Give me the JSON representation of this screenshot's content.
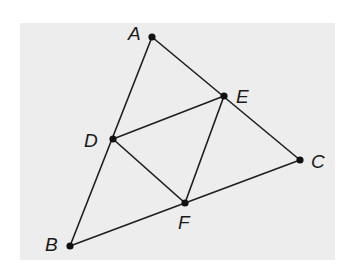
{
  "diagram": {
    "type": "geometry-figure",
    "points": [
      {
        "name": "A",
        "label": "A"
      },
      {
        "name": "B",
        "label": "B"
      },
      {
        "name": "C",
        "label": "C"
      },
      {
        "name": "D",
        "label": "D"
      },
      {
        "name": "E",
        "label": "E"
      },
      {
        "name": "F",
        "label": "F"
      }
    ],
    "segments": [
      {
        "from": "A",
        "to": "B"
      },
      {
        "from": "A",
        "to": "C"
      },
      {
        "from": "B",
        "to": "C"
      },
      {
        "from": "D",
        "to": "E"
      },
      {
        "from": "E",
        "to": "F"
      },
      {
        "from": "D",
        "to": "F"
      }
    ],
    "colors": {
      "background": "#ffffff",
      "panel": "#ededed",
      "ink": "#1e1e1e"
    }
  }
}
